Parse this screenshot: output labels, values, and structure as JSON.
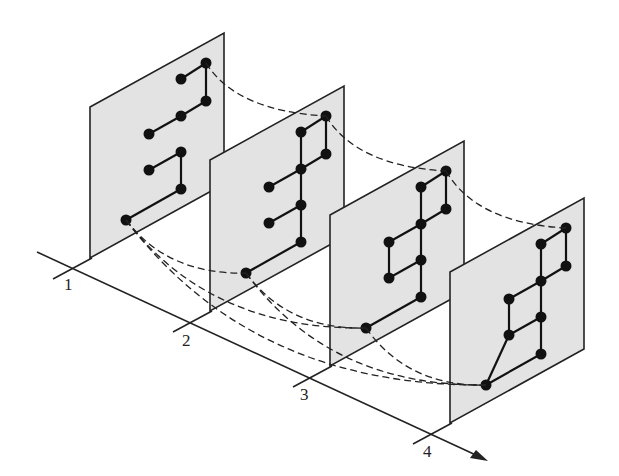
{
  "diagram": {
    "axis_labels": [
      "1",
      "2",
      "3",
      "4"
    ],
    "panels": [
      {
        "id": "1",
        "edges": [
          [
            0,
            1
          ],
          [
            0,
            2
          ],
          [
            2,
            3
          ],
          [
            3,
            4
          ],
          [
            5,
            6
          ],
          [
            5,
            7
          ],
          [
            7,
            8
          ]
        ]
      },
      {
        "id": "2",
        "edges": [
          [
            0,
            1
          ],
          [
            0,
            2
          ],
          [
            1,
            3
          ],
          [
            3,
            4
          ],
          [
            3,
            5
          ],
          [
            5,
            6
          ],
          [
            5,
            7
          ],
          [
            7,
            8
          ]
        ]
      },
      {
        "id": "3",
        "edges": [
          [
            0,
            1
          ],
          [
            0,
            2
          ],
          [
            1,
            3
          ],
          [
            2,
            3
          ],
          [
            3,
            4
          ],
          [
            4,
            6
          ],
          [
            3,
            5
          ],
          [
            5,
            6
          ],
          [
            5,
            7
          ],
          [
            7,
            8
          ]
        ]
      },
      {
        "id": "4",
        "edges": [
          [
            0,
            1
          ],
          [
            0,
            2
          ],
          [
            1,
            3
          ],
          [
            2,
            3
          ],
          [
            3,
            4
          ],
          [
            4,
            6
          ],
          [
            3,
            5
          ],
          [
            5,
            6
          ],
          [
            5,
            7
          ],
          [
            7,
            8
          ],
          [
            6,
            8
          ]
        ]
      }
    ],
    "dashed_links": "top node and bottom root node of each panel connected to those of later panels"
  }
}
